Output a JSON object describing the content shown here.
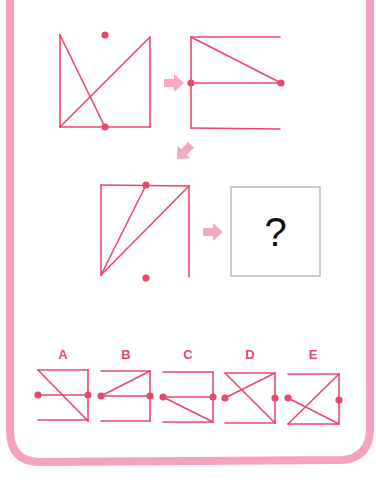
{
  "colors": {
    "line": "#e8496b",
    "dot": "#e8496b",
    "arrow": "#f7a9bf",
    "frame": "#f5a3bb",
    "question_box": "#bdbdbd",
    "text": "#111111",
    "label": "#e8496b"
  },
  "puzzle": {
    "question_mark": "?",
    "sequence": [
      {
        "id": "figure-1",
        "lines": [
          [
            60,
            35,
            60,
            127
          ],
          [
            60,
            127,
            150,
            127
          ],
          [
            150,
            127,
            150,
            37
          ],
          [
            60,
            35,
            105,
            127
          ],
          [
            60,
            127,
            150,
            37
          ]
        ],
        "dots": [
          [
            105,
            35
          ],
          [
            105,
            127
          ]
        ]
      },
      {
        "id": "figure-2",
        "lines": [
          [
            191,
            37,
            191,
            128
          ],
          [
            191,
            37,
            280,
            37
          ],
          [
            191,
            83,
            281,
            83
          ],
          [
            191,
            128,
            280,
            129
          ],
          [
            191,
            37,
            281,
            83
          ]
        ],
        "dots": [
          [
            191,
            83
          ],
          [
            281,
            83
          ]
        ]
      },
      {
        "id": "figure-3",
        "lines": [
          [
            101,
            185,
            189,
            186
          ],
          [
            101,
            185,
            101,
            275
          ],
          [
            189,
            186,
            189,
            277
          ],
          [
            101,
            275,
            146,
            185
          ],
          [
            101,
            275,
            189,
            186
          ]
        ],
        "dots": [
          [
            146,
            185
          ],
          [
            146,
            278
          ]
        ]
      }
    ],
    "arrows": [
      {
        "id": "arrow-1",
        "x": 174,
        "y": 83,
        "rotate": 0
      },
      {
        "id": "arrow-2",
        "x": 184,
        "y": 152,
        "rotate": 135
      },
      {
        "id": "arrow-3",
        "x": 213,
        "y": 232,
        "rotate": 0
      }
    ],
    "question_box": {
      "x": 231,
      "y": 187,
      "w": 89,
      "h": 89
    }
  },
  "options": [
    {
      "label": "A",
      "label_x": 63,
      "lines": [
        [
          38,
          370,
          88,
          370
        ],
        [
          88,
          370,
          88,
          421
        ],
        [
          38,
          395,
          88,
          395
        ],
        [
          38,
          370,
          88,
          421
        ],
        [
          38,
          420,
          88,
          420
        ]
      ],
      "dots": [
        [
          38,
          395
        ],
        [
          88,
          395
        ]
      ]
    },
    {
      "label": "B",
      "label_x": 126,
      "lines": [
        [
          101,
          371,
          150,
          371
        ],
        [
          150,
          371,
          150,
          421
        ],
        [
          101,
          396,
          150,
          396
        ],
        [
          101,
          396,
          150,
          371
        ],
        [
          101,
          421,
          150,
          421
        ]
      ],
      "dots": [
        [
          101,
          396
        ],
        [
          150,
          396
        ]
      ]
    },
    {
      "label": "C",
      "label_x": 188,
      "lines": [
        [
          163,
          372,
          213,
          372
        ],
        [
          213,
          372,
          213,
          422
        ],
        [
          163,
          397,
          213,
          397
        ],
        [
          163,
          397,
          213,
          422
        ],
        [
          163,
          422,
          213,
          422
        ]
      ],
      "dots": [
        [
          163,
          397
        ],
        [
          213,
          397
        ]
      ]
    },
    {
      "label": "D",
      "label_x": 250,
      "lines": [
        [
          225,
          373,
          275,
          373
        ],
        [
          275,
          373,
          275,
          423
        ],
        [
          225,
          373,
          275,
          423
        ],
        [
          225,
          398,
          275,
          373
        ],
        [
          225,
          423,
          275,
          423
        ]
      ],
      "dots": [
        [
          225,
          398
        ],
        [
          275,
          398
        ]
      ]
    },
    {
      "label": "E",
      "label_x": 313,
      "lines": [
        [
          288,
          374,
          339,
          374
        ],
        [
          339,
          374,
          339,
          424
        ],
        [
          288,
          424,
          339,
          374
        ],
        [
          288,
          398,
          339,
          424
        ],
        [
          288,
          424,
          339,
          424
        ]
      ],
      "dots": [
        [
          288,
          398
        ],
        [
          339,
          400
        ]
      ]
    }
  ]
}
